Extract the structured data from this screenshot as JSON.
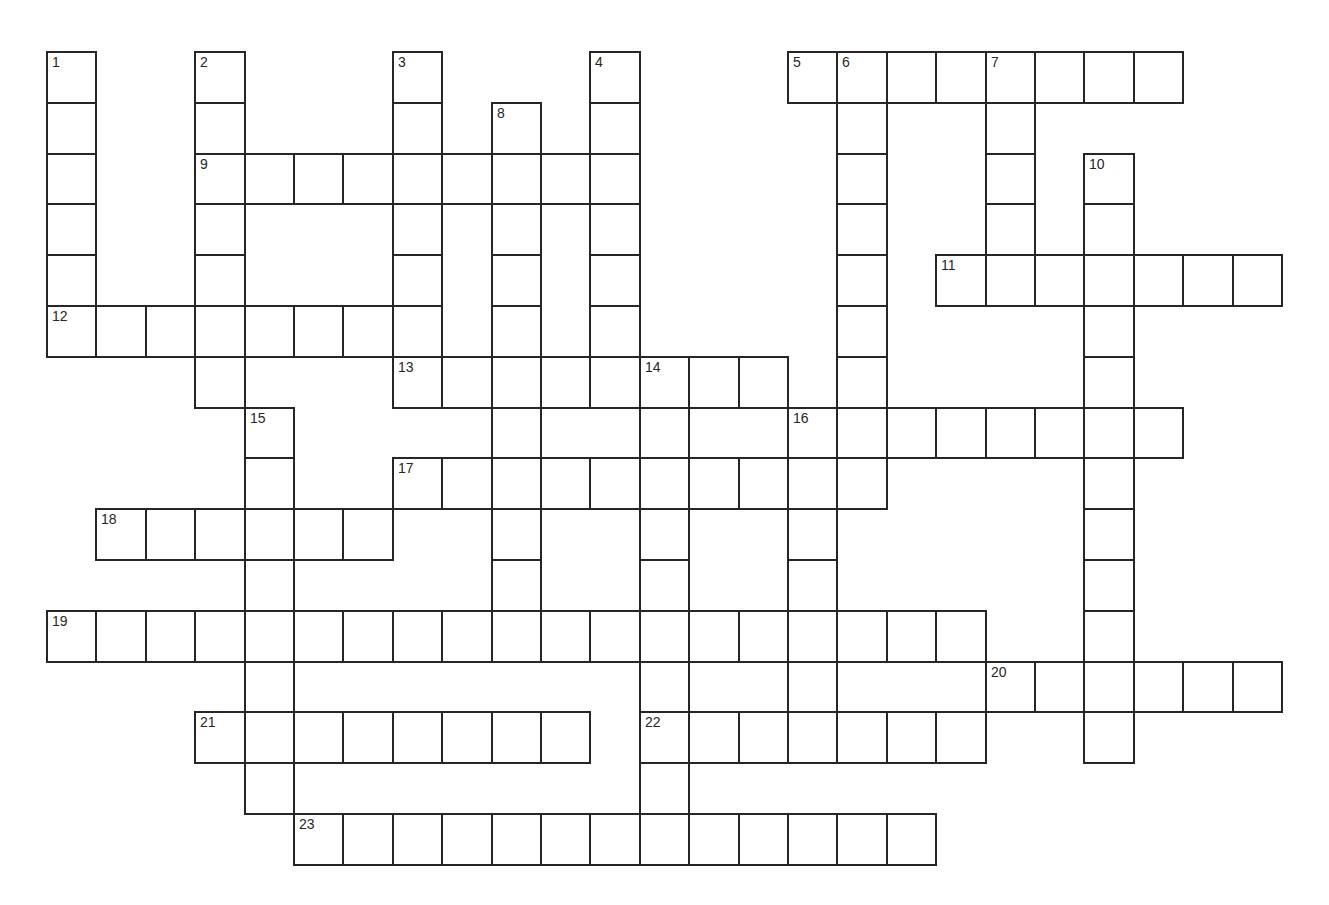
{
  "puzzle": {
    "type": "crossword",
    "grid": {
      "origin_x": 47,
      "origin_y": 52,
      "cell_width": 49.4,
      "cell_height": 50.8,
      "columns": 25,
      "rows": 16,
      "line_color": "#262626",
      "cell_fill": "#ffffff"
    },
    "across": [
      {
        "number": 5,
        "row": 0,
        "col": 15,
        "length": 8
      },
      {
        "number": 9,
        "row": 2,
        "col": 3,
        "length": 9
      },
      {
        "number": 11,
        "row": 4,
        "col": 18,
        "length": 7
      },
      {
        "number": 12,
        "row": 5,
        "col": 0,
        "length": 7
      },
      {
        "number": 13,
        "row": 6,
        "col": 7,
        "length": 8
      },
      {
        "number": 16,
        "row": 7,
        "col": 15,
        "length": 8
      },
      {
        "number": 17,
        "row": 8,
        "col": 7,
        "length": 10
      },
      {
        "number": 18,
        "row": 9,
        "col": 1,
        "length": 6
      },
      {
        "number": 19,
        "row": 11,
        "col": 0,
        "length": 19
      },
      {
        "number": 20,
        "row": 12,
        "col": 19,
        "length": 6
      },
      {
        "number": 21,
        "row": 13,
        "col": 3,
        "length": 8
      },
      {
        "number": 22,
        "row": 13,
        "col": 12,
        "length": 7
      },
      {
        "number": 23,
        "row": 15,
        "col": 5,
        "length": 13
      }
    ],
    "down": [
      {
        "number": 1,
        "row": 0,
        "col": 0,
        "length": 6
      },
      {
        "number": 2,
        "row": 0,
        "col": 3,
        "length": 7
      },
      {
        "number": 3,
        "row": 0,
        "col": 7,
        "length": 6
      },
      {
        "number": 4,
        "row": 0,
        "col": 11,
        "length": 7
      },
      {
        "number": 6,
        "row": 0,
        "col": 16,
        "length": 9
      },
      {
        "number": 7,
        "row": 0,
        "col": 19,
        "length": 5
      },
      {
        "number": 8,
        "row": 1,
        "col": 9,
        "length": 11
      },
      {
        "number": 10,
        "row": 2,
        "col": 21,
        "length": 12
      },
      {
        "number": 14,
        "row": 6,
        "col": 12,
        "length": 10
      },
      {
        "number": 15,
        "row": 7,
        "col": 4,
        "length": 8
      },
      {
        "number": 16,
        "row": 7,
        "col": 15,
        "length": 7
      }
    ],
    "numbered_cells": [
      {
        "number": "1",
        "row": 0,
        "col": 0
      },
      {
        "number": "2",
        "row": 0,
        "col": 3
      },
      {
        "number": "3",
        "row": 0,
        "col": 7
      },
      {
        "number": "4",
        "row": 0,
        "col": 11
      },
      {
        "number": "5",
        "row": 0,
        "col": 15
      },
      {
        "number": "6",
        "row": 0,
        "col": 16
      },
      {
        "number": "7",
        "row": 0,
        "col": 19
      },
      {
        "number": "8",
        "row": 1,
        "col": 9
      },
      {
        "number": "9",
        "row": 2,
        "col": 3
      },
      {
        "number": "10",
        "row": 2,
        "col": 21
      },
      {
        "number": "11",
        "row": 4,
        "col": 18
      },
      {
        "number": "12",
        "row": 5,
        "col": 0
      },
      {
        "number": "13",
        "row": 6,
        "col": 7
      },
      {
        "number": "14",
        "row": 6,
        "col": 12
      },
      {
        "number": "15",
        "row": 7,
        "col": 4
      },
      {
        "number": "16",
        "row": 7,
        "col": 15
      },
      {
        "number": "17",
        "row": 8,
        "col": 7
      },
      {
        "number": "18",
        "row": 9,
        "col": 1
      },
      {
        "number": "19",
        "row": 11,
        "col": 0
      },
      {
        "number": "20",
        "row": 12,
        "col": 19
      },
      {
        "number": "21",
        "row": 13,
        "col": 3
      },
      {
        "number": "22",
        "row": 13,
        "col": 12
      },
      {
        "number": "23",
        "row": 15,
        "col": 5
      }
    ]
  }
}
